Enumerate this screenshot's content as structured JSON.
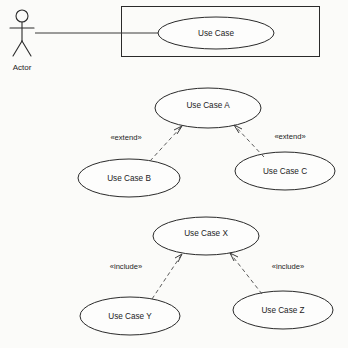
{
  "diagram": {
    "type": "uml-use-case-diagram",
    "background_color": "#fbfbf9",
    "line_color": "#2a2a2a",
    "text_color": "#1c1c1c",
    "actor": {
      "label": "Actor",
      "caption_x": 22,
      "caption_y": 68
    },
    "system_boundary": {
      "x": 121,
      "y": 6,
      "width": 199,
      "height": 51
    },
    "association": {
      "kind": "association",
      "from": "actor",
      "to": "use-case-main",
      "x1": 35,
      "y1": 33,
      "x2": 159,
      "y2": 33
    },
    "use_cases": [
      {
        "id": "use-case-main",
        "label": "Use Case",
        "cx": 216,
        "cy": 33,
        "rx": 58,
        "ry": 16
      },
      {
        "id": "use-case-a",
        "label": "Use Case A",
        "cx": 208,
        "cy": 108,
        "rx": 53,
        "ry": 20
      },
      {
        "id": "use-case-b",
        "label": "Use Case B",
        "cx": 129,
        "cy": 178,
        "rx": 51,
        "ry": 19
      },
      {
        "id": "use-case-c",
        "label": "Use Case C",
        "cx": 285,
        "cy": 171,
        "rx": 50,
        "ry": 19
      },
      {
        "id": "use-case-x",
        "label": "Use Case X",
        "cx": 206,
        "cy": 236,
        "rx": 53,
        "ry": 19
      },
      {
        "id": "use-case-y",
        "label": "Use Case Y",
        "cx": 130,
        "cy": 316,
        "rx": 50,
        "ry": 19
      },
      {
        "id": "use-case-z",
        "label": "Use Case Z",
        "cx": 283,
        "cy": 310,
        "rx": 50,
        "ry": 19
      }
    ],
    "dependencies": [
      {
        "id": "extend-b-to-a",
        "stereotype": "«extend»",
        "from": "use-case-b",
        "to": "use-case-a",
        "x1": 150,
        "y1": 161,
        "x2": 182,
        "y2": 126,
        "label_x": 126,
        "label_y": 138
      },
      {
        "id": "extend-c-to-a",
        "stereotype": "«extend»",
        "from": "use-case-c",
        "to": "use-case-a",
        "x1": 264,
        "y1": 157,
        "x2": 234,
        "y2": 125,
        "label_x": 290,
        "label_y": 137
      },
      {
        "id": "include-y-to-x",
        "stereotype": "«include»",
        "from": "use-case-y",
        "to": "use-case-x",
        "x1": 152,
        "y1": 299,
        "x2": 182,
        "y2": 254,
        "label_x": 126,
        "label_y": 267
      },
      {
        "id": "include-z-to-x",
        "stereotype": "«include»",
        "from": "use-case-z",
        "to": "use-case-x",
        "x1": 262,
        "y1": 294,
        "x2": 230,
        "y2": 253,
        "label_x": 288,
        "label_y": 267
      }
    ]
  }
}
